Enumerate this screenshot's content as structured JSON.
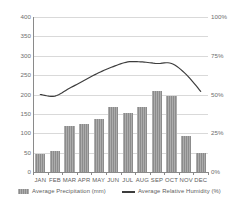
{
  "chart_data": {
    "type": "bar",
    "title": "",
    "subtitle": "",
    "xlabel": "",
    "ylabel": "",
    "y2label": "",
    "categories": [
      "JAN",
      "FEB",
      "MAR",
      "APR",
      "MAY",
      "JUN",
      "JUL",
      "AUG",
      "SEP",
      "OCT",
      "NOV",
      "DEC"
    ],
    "series": [
      {
        "name": "Average Precipitation (mm)",
        "type": "bar",
        "axis": "left",
        "color": "#8c8c8c",
        "values": [
          47,
          54,
          118,
          123,
          137,
          167,
          153,
          168,
          210,
          197,
          93,
          50
        ]
      },
      {
        "name": "Average Relative Humidity (%)",
        "type": "line",
        "axis": "right",
        "color": "#3d3d3d",
        "values": [
          50,
          49,
          54,
          59,
          64,
          68,
          71,
          71,
          70,
          70,
          63,
          52
        ]
      }
    ],
    "ylim": [
      0,
      400
    ],
    "y2lim": [
      0,
      100
    ],
    "yticks": [
      "0",
      "50",
      "100",
      "150",
      "200",
      "250",
      "300",
      "350",
      "400"
    ],
    "ytick_values": [
      0,
      50,
      100,
      150,
      200,
      250,
      300,
      350,
      400
    ],
    "y2ticks": [
      "0%",
      "25%",
      "50%",
      "75%",
      "100%"
    ],
    "y2tick_values": [
      0,
      25,
      50,
      75,
      100
    ],
    "grid": true,
    "grid_axis": "y",
    "grid_color": "#d9d9d9",
    "legend_position": "bottom",
    "background": "#ffffff",
    "axis_color": "#8a8a8a",
    "tick_label_color": "#6e6e6e"
  },
  "legend": {
    "items": [
      {
        "label": "Average Precipitation (mm)",
        "marker": "bar-swatch-icon"
      },
      {
        "label": "Average Relative Humidity (%)",
        "marker": "line-swatch-icon"
      }
    ]
  }
}
